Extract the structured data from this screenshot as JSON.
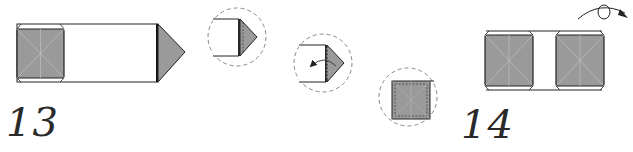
{
  "colors": {
    "paper_white": "#ffffff",
    "paper_colored": "#9a9a9a",
    "line": "#222222",
    "crease": "#c8c8c8",
    "dashed_circle": "#888888"
  },
  "steps": [
    {
      "number": "13",
      "description": "Long strip with a colored square on the left and a colored triangular point on the right",
      "detail_views": [
        {
          "label": "detail-1",
          "content": "Strip end with triangular point"
        },
        {
          "label": "detail-2",
          "content": "Fold the triangle back (curved arrow)"
        },
        {
          "label": "detail-3",
          "content": "Result: colored square"
        }
      ]
    },
    {
      "number": "14",
      "description": "Two colored squares connected by a white strip",
      "symbol": "turn-over-arrow"
    }
  ]
}
